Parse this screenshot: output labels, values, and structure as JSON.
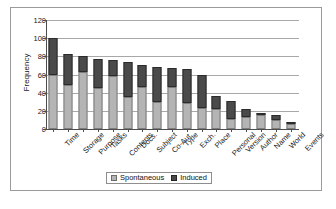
{
  "chart_data": {
    "type": "bar",
    "subtype": "stacked-vertical",
    "title": "",
    "xlabel": "",
    "ylabel": "Frequency",
    "ylim": [
      0,
      120
    ],
    "yticks": [
      0,
      20,
      40,
      60,
      80,
      100,
      120
    ],
    "grid": true,
    "grid_axis": "y",
    "legend": {
      "position": "bottom-center",
      "entries": [
        "Spontaneous",
        "Induced"
      ]
    },
    "categories": [
      "Time",
      "Storage",
      "Purpose",
      "Tasks",
      "Contents",
      "Docs.",
      "Subject",
      "Co-Aut.",
      "Type",
      "Exch.",
      "Place",
      "Personal",
      "Version",
      "Author",
      "Name",
      "World",
      "Events"
    ],
    "series": [
      {
        "name": "Spontaneous",
        "color": "#b4b4b4",
        "values": [
          59,
          48,
          63,
          45,
          58,
          35,
          46,
          30,
          46,
          29,
          23,
          22,
          11,
          13,
          15,
          10,
          5
        ]
      },
      {
        "name": "Induced",
        "color": "#4a4a4a",
        "values": [
          41,
          35,
          17,
          32,
          18,
          39,
          24,
          38,
          21,
          37,
          37,
          14,
          20,
          9,
          3,
          5,
          1
        ]
      }
    ],
    "totals": [
      100,
      83,
      80,
      77,
      76,
      74,
      70,
      68,
      67,
      66,
      60,
      36,
      31,
      22,
      18,
      15,
      6
    ]
  }
}
